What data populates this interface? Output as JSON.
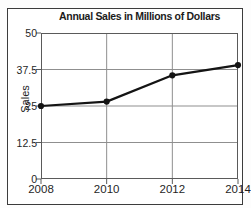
{
  "chart_data": {
    "type": "line",
    "title": "Annual Sales in Millions of Dollars",
    "categories": [
      "2008",
      "2010",
      "2012",
      "2014"
    ],
    "series": [
      {
        "name": "Sales",
        "values": [
          25,
          26.5,
          35.5,
          39
        ]
      }
    ],
    "xlabel": "",
    "ylabel": "Sales",
    "ylim": [
      0,
      50
    ],
    "y_ticks": [
      0,
      12.5,
      25,
      37.5,
      50
    ],
    "grid": true,
    "legend": "none",
    "marker": "circle",
    "line_color": "#141414"
  },
  "colors": {
    "grid": "#8f8f8f",
    "axis": "#5a5a5a",
    "frame_border": "#3c3c3c",
    "background": "#ffffff",
    "text": "#1c1c1c"
  }
}
